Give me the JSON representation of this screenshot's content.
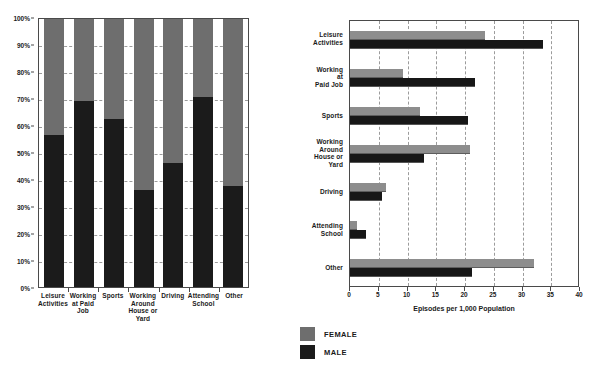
{
  "legend": {
    "items": [
      {
        "label": "FEMALE",
        "color": "#6e6e6e",
        "key": "female"
      },
      {
        "label": "MALE",
        "color": "#1b1b1b",
        "key": "male"
      }
    ]
  },
  "left": {
    "categories": [
      "Leisure\nActivities",
      "Working\nat Paid\nJob",
      "Sports",
      "Working\nAround\nHouse or\nYard",
      "Driving",
      "Attending\nSchool",
      "Other"
    ],
    "yticks": [
      "0%",
      "10%",
      "20%",
      "30%",
      "40%",
      "50%",
      "60%",
      "70%",
      "80%",
      "90%",
      "100%"
    ]
  },
  "right": {
    "categories": [
      "Leisure\nActivities",
      "Working\nat\nPaid Job",
      "Sports",
      "Working\nAround\nHouse or\nYard",
      "Driving",
      "Attending\nSchool",
      "Other"
    ],
    "xticks": [
      "0",
      "5",
      "10",
      "15",
      "20",
      "25",
      "30",
      "35",
      "40"
    ],
    "xtitle": "Episodes per 1,000 Population"
  },
  "chart_data": [
    {
      "type": "bar",
      "id": "left-percent-distribution",
      "subtype": "stacked-100-percent-column",
      "title": "",
      "xlabel": "",
      "ylabel": "",
      "ylim": [
        0,
        100
      ],
      "ytick_values": [
        0,
        10,
        20,
        30,
        40,
        50,
        60,
        70,
        80,
        90,
        100
      ],
      "ytick_labels": [
        "0%",
        "10%",
        "20%",
        "30%",
        "40%",
        "50%",
        "60%",
        "70%",
        "80%",
        "90%",
        "100%"
      ],
      "grid": true,
      "grid_axis": "y",
      "legend_position": "bottom-center",
      "categories": [
        "Leisure Activities",
        "Working at Paid Job",
        "Sports",
        "Working Around House or Yard",
        "Driving",
        "Attending School",
        "Other"
      ],
      "series": [
        {
          "name": "MALE",
          "color": "#1b1b1b",
          "values": [
            57.0,
            69.5,
            63.0,
            36.5,
            46.5,
            71.0,
            38.0
          ]
        },
        {
          "name": "FEMALE",
          "color": "#6e6e6e",
          "values": [
            43.0,
            30.5,
            37.0,
            63.5,
            53.5,
            29.0,
            62.0
          ]
        }
      ]
    },
    {
      "type": "bar",
      "id": "right-episodes-per-1000",
      "subtype": "grouped-horizontal-bar",
      "title": "",
      "xlabel": "Episodes per 1,000 Population",
      "ylabel": "",
      "xlim": [
        0,
        40
      ],
      "xtick_values": [
        0,
        5,
        10,
        15,
        20,
        25,
        30,
        35,
        40
      ],
      "xtick_labels": [
        "0",
        "5",
        "10",
        "15",
        "20",
        "25",
        "30",
        "35",
        "40"
      ],
      "grid": true,
      "grid_axis": "x",
      "legend_position": "bottom-center",
      "categories": [
        "Leisure Activities",
        "Working at Paid Job",
        "Sports",
        "Working Around House or Yard",
        "Driving",
        "Attending School",
        "Other"
      ],
      "series": [
        {
          "name": "FEMALE",
          "color": "#8d8d8d",
          "values": [
            23.4,
            9.2,
            12.1,
            20.8,
            6.3,
            1.3,
            32.0
          ]
        },
        {
          "name": "MALE",
          "color": "#171717",
          "values": [
            33.5,
            21.7,
            20.6,
            12.9,
            5.6,
            2.7,
            21.2
          ]
        }
      ]
    }
  ]
}
